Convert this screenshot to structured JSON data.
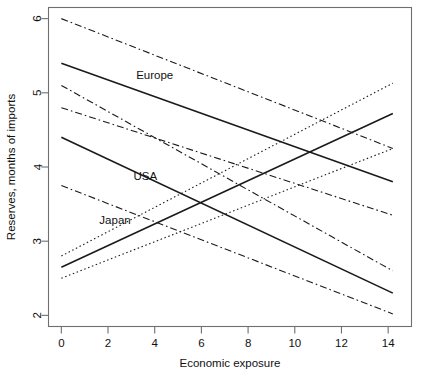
{
  "chart_data": {
    "type": "line",
    "title": "",
    "subtitle": "",
    "xlabel": "Economic exposure",
    "ylabel": "Reserves, months of imports",
    "xlim": [
      -0.55,
      15.0
    ],
    "ylim": [
      1.85,
      6.15
    ],
    "xticks": [
      0,
      2,
      4,
      6,
      8,
      10,
      12,
      14
    ],
    "yticks": [
      2,
      3,
      4,
      5,
      6
    ],
    "xtick_labels": [
      "0",
      "2",
      "4",
      "6",
      "8",
      "10",
      "12",
      "14"
    ],
    "ytick_labels": [
      "2",
      "3",
      "4",
      "5",
      "6"
    ],
    "grid": false,
    "legend_position": "inline-annotations",
    "frame": "box",
    "x_domain_drawn": [
      0,
      14.2
    ],
    "series": [
      {
        "name": "Europe",
        "label": "Europe",
        "linestyle": "solid",
        "color": "#1a1a1a",
        "x": [
          0,
          14.2
        ],
        "values": [
          5.4,
          3.8
        ],
        "slope": -0.1127,
        "intercept": 5.4,
        "bands": [
          {
            "name": "Europe upper confidence band",
            "linestyle": "dashdot",
            "x": [
              0,
              14.2
            ],
            "values": [
              6.0,
              4.25
            ]
          },
          {
            "name": "Europe lower confidence band",
            "linestyle": "dashdot",
            "x": [
              0,
              14.2
            ],
            "values": [
              4.8,
              3.35
            ]
          }
        ]
      },
      {
        "name": "USA",
        "label": "USA",
        "linestyle": "solid",
        "color": "#1a1a1a",
        "x": [
          0,
          14.2
        ],
        "values": [
          4.4,
          2.3
        ],
        "slope": -0.1479,
        "intercept": 4.4,
        "bands": [
          {
            "name": "USA upper confidence band",
            "linestyle": "dashdot",
            "x": [
              0,
              14.2
            ],
            "values": [
              5.1,
              2.6
            ]
          },
          {
            "name": "USA lower confidence band",
            "linestyle": "dashdot",
            "x": [
              0,
              14.2
            ],
            "values": [
              3.75,
              2.02
            ]
          }
        ]
      },
      {
        "name": "Japan",
        "label": "Japan",
        "linestyle": "solid",
        "color": "#1a1a1a",
        "x": [
          0,
          14.2
        ],
        "values": [
          2.65,
          4.72
        ],
        "slope": 0.1458,
        "intercept": 2.65,
        "bands": [
          {
            "name": "Japan upper confidence band",
            "linestyle": "dotted",
            "x": [
              0,
              14.2
            ],
            "values": [
              2.8,
              5.13
            ]
          },
          {
            "name": "Japan lower confidence band",
            "linestyle": "dotted",
            "x": [
              0,
              14.2
            ],
            "values": [
              2.5,
              4.25
            ]
          }
        ]
      }
    ],
    "annotations": [
      {
        "text": "Europe",
        "x": 4.0,
        "y": 5.18
      },
      {
        "text": "USA",
        "x": 3.6,
        "y": 3.82
      },
      {
        "text": "Japan",
        "x": 2.3,
        "y": 3.23
      }
    ]
  }
}
